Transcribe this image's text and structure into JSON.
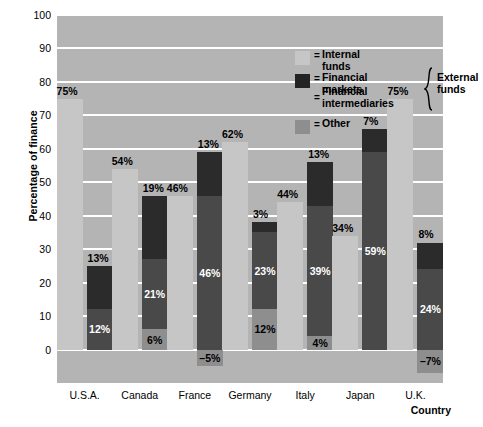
{
  "chart_data": {
    "type": "bar",
    "title": "",
    "subtitle": "",
    "xlabel": "Country",
    "ylabel": "Percentage of finance",
    "ylim": [
      -10,
      100
    ],
    "yticks": [
      0,
      10,
      20,
      30,
      40,
      50,
      60,
      70,
      80,
      90,
      100
    ],
    "grid": true,
    "legend_position": "inside-top-right",
    "categories": [
      "U.S.A.",
      "Canada",
      "France",
      "Germany",
      "Italy",
      "Japan",
      "U.K."
    ],
    "series": [
      {
        "name": "Internal funds",
        "values": [
          75,
          54,
          46,
          62,
          44,
          34,
          75
        ],
        "color": "#c6c6c6"
      },
      {
        "name": "Financial markets",
        "values": [
          13,
          19,
          13,
          3,
          13,
          7,
          8
        ],
        "color": "#2b2b2b"
      },
      {
        "name": "Financial intermediaries",
        "values": [
          12,
          21,
          46,
          23,
          39,
          59,
          24
        ],
        "color": "#494949"
      },
      {
        "name": "Other",
        "values": [
          0,
          6,
          -5,
          12,
          4,
          0,
          -7
        ],
        "color": "#8e8e8e"
      }
    ],
    "bars": [
      {
        "category": "U.S.A.",
        "internal": {
          "value": 75,
          "label": "75%"
        },
        "stack": [
          {
            "key": "markets",
            "value": 13,
            "label": "13%",
            "label_position": "outside-top"
          },
          {
            "key": "intermediaries",
            "value": 12,
            "label": "12%",
            "label_position": "inside"
          }
        ]
      },
      {
        "category": "Canada",
        "internal": {
          "value": 54,
          "label": "54%"
        },
        "stack": [
          {
            "key": "markets",
            "value": 19,
            "label": "19%",
            "label_position": "outside-top"
          },
          {
            "key": "intermediaries",
            "value": 21,
            "label": "21%",
            "label_position": "inside"
          },
          {
            "key": "other",
            "value": 6,
            "label": "6%",
            "label_position": "inside"
          }
        ]
      },
      {
        "category": "France",
        "internal": {
          "value": 46,
          "label": "46%"
        },
        "stack": [
          {
            "key": "markets",
            "value": 13,
            "label": "13%",
            "label_position": "outside-top"
          },
          {
            "key": "intermediaries",
            "value": 46,
            "label": "46%",
            "label_position": "inside"
          },
          {
            "key": "other",
            "value": -5,
            "label": "–5%",
            "label_position": "below-axis"
          }
        ]
      },
      {
        "category": "Germany",
        "internal": {
          "value": 62,
          "label": "62%"
        },
        "stack": [
          {
            "key": "markets",
            "value": 3,
            "label": "3%",
            "label_position": "outside-top"
          },
          {
            "key": "intermediaries",
            "value": 23,
            "label": "23%",
            "label_position": "inside"
          },
          {
            "key": "other",
            "value": 12,
            "label": "12%",
            "label_position": "inside"
          }
        ]
      },
      {
        "category": "Italy",
        "internal": {
          "value": 44,
          "label": "44%"
        },
        "stack": [
          {
            "key": "markets",
            "value": 13,
            "label": "13%",
            "label_position": "outside-top"
          },
          {
            "key": "intermediaries",
            "value": 39,
            "label": "39%",
            "label_position": "inside"
          },
          {
            "key": "other",
            "value": 4,
            "label": "4%",
            "label_position": "inside"
          }
        ]
      },
      {
        "category": "Japan",
        "internal": {
          "value": 34,
          "label": "34%"
        },
        "stack": [
          {
            "key": "markets",
            "value": 7,
            "label": "7%",
            "label_position": "outside-top"
          },
          {
            "key": "intermediaries",
            "value": 59,
            "label": "59%",
            "label_position": "inside"
          }
        ]
      },
      {
        "category": "U.K.",
        "internal": {
          "value": 75,
          "label": "75%"
        },
        "stack": [
          {
            "key": "markets",
            "value": 8,
            "label": "8%",
            "label_position": "outside-top"
          },
          {
            "key": "intermediaries",
            "value": 24,
            "label": "24%",
            "label_position": "inside"
          },
          {
            "key": "other",
            "value": -7,
            "label": "–7%",
            "label_position": "below-axis"
          }
        ]
      }
    ]
  },
  "legend": {
    "equals": "=",
    "items": [
      {
        "key": "internal",
        "label": "Internal funds",
        "color": "#c6c6c6"
      },
      {
        "key": "markets",
        "label": "Financial markets",
        "color": "#2b2b2b"
      },
      {
        "key": "intermediaries",
        "label": "Financial\nintermediaries",
        "color": "#494949"
      },
      {
        "key": "other",
        "label": "Other",
        "color": "#8e8e8e"
      }
    ],
    "bracket_label": "External\nfunds"
  },
  "axes": {
    "y_title": "Percentage of finance",
    "x_title": "Country"
  },
  "colors": {
    "plot_background": "#b4b4b4",
    "gridline": "#ffffff",
    "page_background": "#ffffff",
    "text": "#000000"
  }
}
